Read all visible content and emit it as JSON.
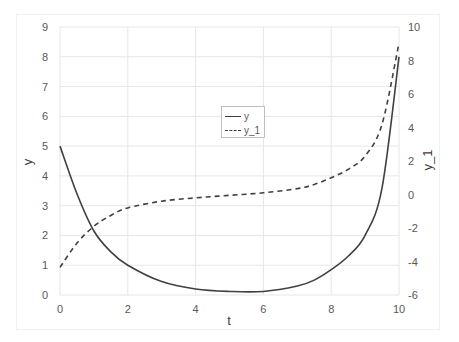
{
  "chart_data": {
    "type": "line",
    "title": "",
    "xlabel": "t",
    "ylabel": "y",
    "y2label": "y_1",
    "xlim": [
      0,
      10
    ],
    "ylim": [
      0,
      9
    ],
    "y2lim": [
      -6,
      10
    ],
    "x_ticks": [
      "0",
      "2",
      "4",
      "6",
      "8",
      "10"
    ],
    "y_ticks": [
      "0",
      "1",
      "2",
      "3",
      "4",
      "5",
      "6",
      "7",
      "8",
      "9"
    ],
    "y2_ticks": [
      "-6",
      "-4",
      "-2",
      "0",
      "2",
      "4",
      "6",
      "8",
      "10"
    ],
    "grid": true,
    "legend_position": "center",
    "x": [
      0,
      0.5,
      1,
      1.5,
      2,
      3,
      4,
      5,
      6,
      7,
      7.5,
      8,
      8.5,
      9,
      9.5,
      10
    ],
    "series": [
      {
        "name": "y",
        "axis": "left",
        "style": "solid",
        "values": [
          5.0,
          3.4,
          2.15,
          1.45,
          1.0,
          0.45,
          0.2,
          0.12,
          0.12,
          0.3,
          0.5,
          0.85,
          1.3,
          2.0,
          3.6,
          8.0
        ]
      },
      {
        "name": "y_1",
        "axis": "right",
        "style": "dashed",
        "values": [
          -4.35,
          -2.9,
          -1.9,
          -1.25,
          -0.8,
          -0.4,
          -0.2,
          -0.05,
          0.1,
          0.35,
          0.6,
          1.0,
          1.5,
          2.3,
          4.2,
          9.05
        ]
      }
    ]
  },
  "legend": {
    "items": [
      "y",
      "y_1"
    ]
  }
}
